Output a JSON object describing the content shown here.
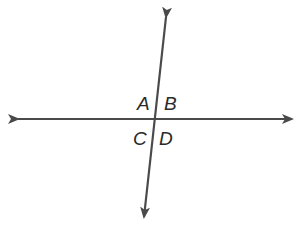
{
  "diagram": {
    "type": "intersecting-lines",
    "line_color": "#4a4a4a",
    "label_color": "#2a2a2a",
    "intersection": {
      "x": 155,
      "y": 119
    },
    "lines": [
      {
        "id": "horizontal",
        "from": {
          "x": 5,
          "y": 119
        },
        "to": {
          "x": 303,
          "y": 119
        },
        "arrows": "both"
      },
      {
        "id": "transversal",
        "from": {
          "x": 167,
          "y": 5
        },
        "to": {
          "x": 143,
          "y": 228
        },
        "arrows": "both"
      }
    ],
    "angles": [
      {
        "label": "A",
        "position": "upper-left"
      },
      {
        "label": "B",
        "position": "upper-right"
      },
      {
        "label": "C",
        "position": "lower-left"
      },
      {
        "label": "D",
        "position": "lower-right"
      }
    ]
  }
}
